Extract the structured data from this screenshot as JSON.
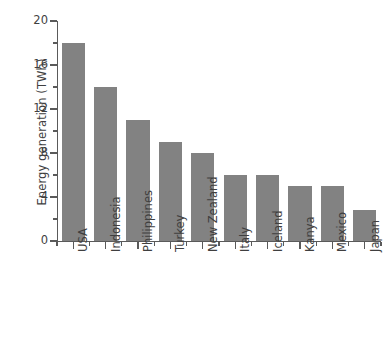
{
  "chart_data": {
    "type": "bar",
    "title": "",
    "subtitle": "",
    "xlabel": "",
    "ylabel": "Energy generation (TWh)",
    "categories": [
      "USA",
      "Indonesia",
      "Philippines",
      "Turkey",
      "New Zealand",
      "Italy",
      "Iceland",
      "Kanya",
      "Mexico",
      "Japan"
    ],
    "values": [
      18,
      14,
      11,
      9,
      8,
      6,
      6,
      5,
      5,
      2.8
    ],
    "ylim": [
      0,
      20
    ],
    "y_major_ticks": [
      0,
      4,
      8,
      12,
      16,
      20
    ],
    "y_minor_ticks": [
      2,
      6,
      10,
      14,
      18
    ],
    "y_tick_labels": [
      "0",
      "4",
      "8",
      "12",
      "16",
      "20"
    ],
    "grid": false,
    "legend": null,
    "legend_position": "none",
    "bar_color": "#828282",
    "axis_color": "#5a5a5a",
    "text_color": "#3f3f3f",
    "background": "#ffffff",
    "x_tick_rotation": 90,
    "spines": [
      "left",
      "bottom"
    ],
    "annotations": []
  }
}
